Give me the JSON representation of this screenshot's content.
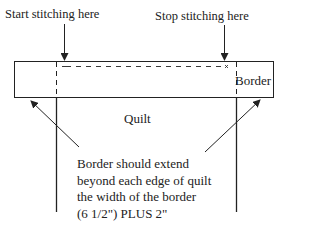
{
  "labels": {
    "start": "Start stitching here",
    "stop": "Stop stitching here",
    "border": "Border",
    "quilt": "Quilt"
  },
  "note": {
    "lines": [
      "Border should extend",
      "beyond each edge of quilt",
      "the width of the border",
      "(6 1/2\") PLUS 2\""
    ]
  },
  "colors": {
    "line": "#222222",
    "background": "#ffffff"
  }
}
